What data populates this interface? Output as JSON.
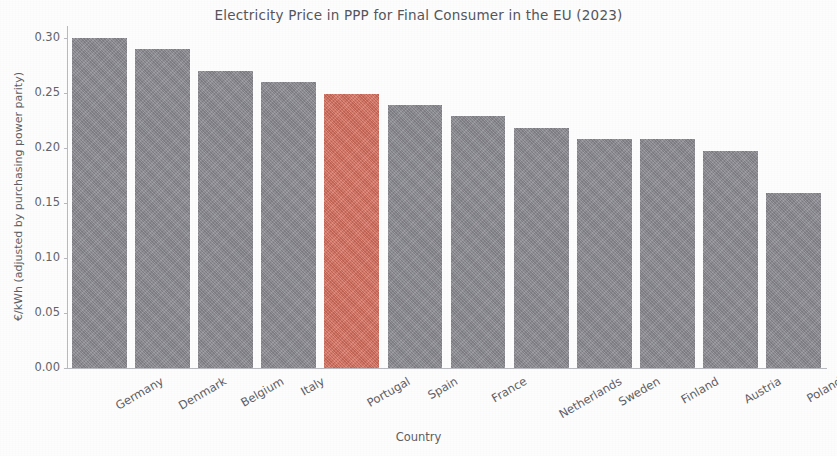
{
  "chart_data": {
    "type": "bar",
    "title": "Electricity Price in PPP for Final Consumer in the EU (2023)",
    "xlabel": "Country",
    "ylabel": "€/kWh (adjusted by purchasing power parity)",
    "categories": [
      "Germany",
      "Denmark",
      "Belgium",
      "Italy",
      "Portugal",
      "Spain",
      "France",
      "Netherlands",
      "Sweden",
      "Finland",
      "Austria",
      "Poland"
    ],
    "values": [
      0.3,
      0.29,
      0.27,
      0.26,
      0.249,
      0.239,
      0.229,
      0.218,
      0.208,
      0.208,
      0.197,
      0.159
    ],
    "highlight_category": "Portugal",
    "highlight_index": 4,
    "bar_color": "#8c8c94",
    "highlight_color": "#d9705f",
    "ylim": [
      0.0,
      0.315
    ],
    "ytick_values": [
      0.0,
      0.05,
      0.1,
      0.15,
      0.2,
      0.25,
      0.3
    ],
    "ytick_labels": [
      "0.00",
      "0.05",
      "0.10",
      "0.15",
      "0.20",
      "0.25",
      "0.30"
    ],
    "grid": false,
    "legend": false,
    "xtick_rotation": -30,
    "axis_color": "#b9bac0",
    "text_color": "#5d5e64",
    "background_color": "#fdfdfd"
  }
}
